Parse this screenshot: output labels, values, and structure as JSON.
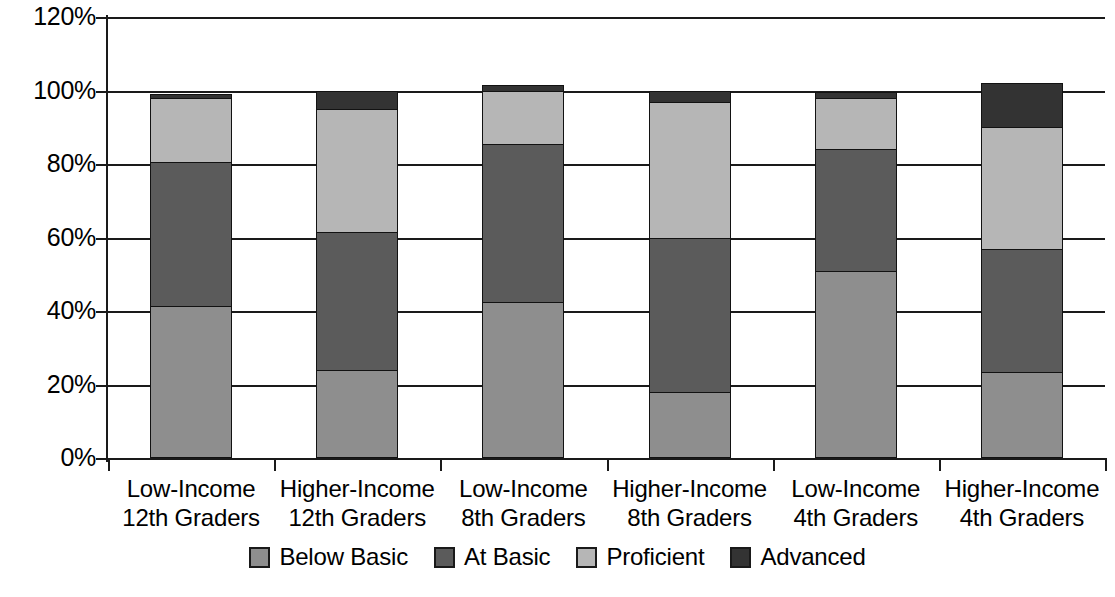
{
  "chart_data": {
    "type": "bar",
    "subtype": "stacked-bar",
    "title": "",
    "xlabel": "",
    "ylabel": "",
    "ylim": [
      0,
      120
    ],
    "ytick_values": [
      0,
      20,
      40,
      60,
      80,
      100,
      120
    ],
    "ytick_labels": [
      "0%",
      "20%",
      "40%",
      "60%",
      "80%",
      "100%",
      "120%"
    ],
    "grid": true,
    "legend_position": "bottom",
    "categories": [
      "Low-Income 12th Graders",
      "Higher-Income 12th Graders",
      "Low-Income 8th Graders",
      "Higher-Income 8th Graders",
      "Low-Income 4th Graders",
      "Higher-Income 4th Graders"
    ],
    "category_lines": [
      [
        "Low-Income",
        "12th Graders"
      ],
      [
        "Higher-Income",
        "12th Graders"
      ],
      [
        "Low-Income",
        "8th Graders"
      ],
      [
        "Higher-Income",
        "8th Graders"
      ],
      [
        "Low-Income",
        "4th Graders"
      ],
      [
        "Higher-Income",
        "4th Graders"
      ]
    ],
    "series": [
      {
        "name": "Below Basic",
        "color": "#8e8e8e",
        "values": [
          41.5,
          24.0,
          42.5,
          18.0,
          51.0,
          23.5
        ]
      },
      {
        "name": "At Basic",
        "color": "#5b5b5b",
        "values": [
          39.0,
          37.5,
          43.0,
          42.0,
          33.0,
          33.5
        ]
      },
      {
        "name": "Proficient",
        "color": "#b6b6b6",
        "values": [
          17.5,
          33.5,
          14.5,
          37.0,
          14.0,
          33.0
        ]
      },
      {
        "name": "Advanced",
        "color": "#333333",
        "values": [
          1.0,
          5.0,
          1.5,
          3.0,
          1.5,
          12.0
        ]
      }
    ],
    "totals": [
      99.0,
      100.0,
      101.5,
      100.0,
      99.5,
      102.0
    ]
  },
  "legend": {
    "items": [
      {
        "label": "Below Basic",
        "color": "#8e8e8e"
      },
      {
        "label": "At Basic",
        "color": "#5b5b5b"
      },
      {
        "label": "Proficient",
        "color": "#b6b6b6"
      },
      {
        "label": "Advanced",
        "color": "#333333"
      }
    ]
  },
  "axis": {
    "y_labels": [
      "120%",
      "100%",
      "80%",
      "60%",
      "40%",
      "20%",
      "0%"
    ]
  },
  "colors": {
    "axis": "#1a1a1a",
    "gridline": "#1a1a1a",
    "background": "#ffffff",
    "segment_border": "#121212"
  }
}
